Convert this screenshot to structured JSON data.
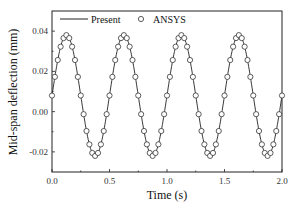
{
  "chart_data": {
    "type": "line",
    "title": "",
    "xlabel": "Time (s)",
    "ylabel": "Mid-span deflection (mm)",
    "xlim": [
      0.0,
      2.0
    ],
    "ylim": [
      -0.03,
      0.05
    ],
    "xticks": [
      0.0,
      0.5,
      1.0,
      1.5,
      2.0
    ],
    "xtick_labels": [
      "0.0",
      "0.5",
      "1.0",
      "1.5",
      "2.0"
    ],
    "yticks": [
      -0.02,
      0.0,
      0.02,
      0.04
    ],
    "ytick_labels": [
      "-0.02",
      "0.00",
      "0.02",
      "0.04"
    ],
    "grid": false,
    "legend_position": "top",
    "series": [
      {
        "name": "Present",
        "style": "solid-line",
        "color": "#222222",
        "model": {
          "offset": 0.008,
          "amplitude": 0.03,
          "frequency_hz": 2.0,
          "phase": 0.0
        },
        "x": [
          0.0,
          0.025,
          0.05,
          0.075,
          0.1,
          0.125,
          0.15,
          0.175,
          0.2,
          0.225,
          0.25,
          0.275,
          0.3,
          0.325,
          0.35,
          0.375,
          0.4,
          0.425,
          0.45,
          0.475,
          0.5
        ],
        "values": [
          0.008,
          0.0173,
          0.0256,
          0.0323,
          0.0365,
          0.038,
          0.0365,
          0.0323,
          0.0256,
          0.0173,
          0.008,
          -0.0013,
          -0.0096,
          -0.0163,
          -0.0205,
          -0.022,
          -0.0205,
          -0.0163,
          -0.0096,
          -0.0013,
          0.008
        ]
      },
      {
        "name": "ANSYS",
        "style": "open-circle-markers",
        "color": "#333333",
        "marker_spacing_s": 0.025,
        "note_values": "same periodic waveform as Present, sampled every 0.025 s from 0.0 to 2.0 s",
        "x": [
          0.0,
          0.025,
          0.05,
          0.075,
          0.1,
          0.125,
          0.15,
          0.175,
          0.2,
          0.225,
          0.25,
          0.275,
          0.3,
          0.325,
          0.35,
          0.375,
          0.4,
          0.425,
          0.45,
          0.475,
          0.5
        ],
        "values": [
          0.008,
          0.0173,
          0.0256,
          0.0323,
          0.0365,
          0.038,
          0.0365,
          0.0323,
          0.0256,
          0.0173,
          0.008,
          -0.0013,
          -0.0096,
          -0.0163,
          -0.0205,
          -0.022,
          -0.0205,
          -0.0163,
          -0.0096,
          -0.0013,
          0.008
        ]
      }
    ],
    "summary": {
      "max": 0.038,
      "min": -0.022,
      "period_s": 0.5,
      "cycles_shown": 4
    }
  },
  "legend": {
    "present_label": "Present",
    "ansys_label": "ANSYS"
  },
  "axes": {
    "xlabel": "Time (s)",
    "ylabel": "Mid-span deflection (mm)"
  }
}
